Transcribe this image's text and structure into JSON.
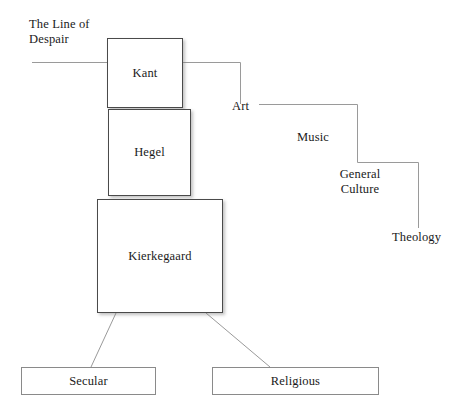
{
  "diagram": {
    "title": "The Line of Despair",
    "type": "concept-diagram",
    "background_color": "#ffffff",
    "line_color": "#8a8a8a",
    "box_border_color": "#4a4a4a",
    "text_color": "#1a1a1a",
    "annotation": {
      "line_of_despair_label": "The Line of\nDespair"
    },
    "thinker_boxes": [
      {
        "label": "Kant",
        "order": 1
      },
      {
        "label": "Hegel",
        "order": 2
      },
      {
        "label": "Kierkegaard",
        "order": 3
      }
    ],
    "descent_steps": [
      {
        "label": "Art",
        "step": 1
      },
      {
        "label": "Music",
        "step": 2
      },
      {
        "label": "General\nCulture",
        "step": 3
      },
      {
        "label": "Theology",
        "step": 4
      }
    ],
    "outcome_boxes": [
      {
        "label": "Secular"
      },
      {
        "label": "Religious"
      }
    ]
  }
}
